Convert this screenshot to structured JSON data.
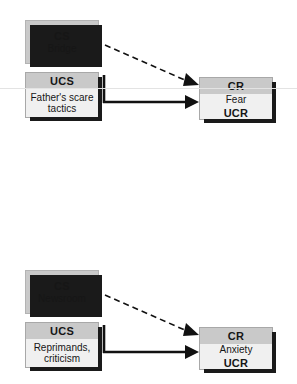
{
  "diagram": {
    "type": "classical-conditioning",
    "hairline_color": "#e3e3e3",
    "box_fill_solid": "#c9c9c9",
    "box_fill_band": "#c9c9c9",
    "box_fill_body": "#f0f0f0",
    "shadow_color": "#1a1a1a",
    "arrow_color": "#111111",
    "panels": [
      {
        "id": "panel-bridge",
        "cs": {
          "code": "CS",
          "text": "Bridge"
        },
        "ucs": {
          "code": "UCS",
          "text": "Father's scare tactics"
        },
        "cr": {
          "code": "CR",
          "text": "Fear",
          "code2": "UCR"
        },
        "links": [
          {
            "from": "cs",
            "to": "cr",
            "style": "dashed"
          },
          {
            "from": "ucs",
            "to": "cr",
            "style": "solid"
          }
        ]
      },
      {
        "id": "panel-newsroom",
        "cs": {
          "code": "CS",
          "text": "Newsroom"
        },
        "ucs": {
          "code": "UCS",
          "text": "Reprimands, criticism"
        },
        "cr": {
          "code": "CR",
          "text": "Anxiety",
          "code2": "UCR"
        },
        "links": [
          {
            "from": "cs",
            "to": "cr",
            "style": "dashed"
          },
          {
            "from": "ucs",
            "to": "cr",
            "style": "solid"
          }
        ]
      }
    ]
  }
}
